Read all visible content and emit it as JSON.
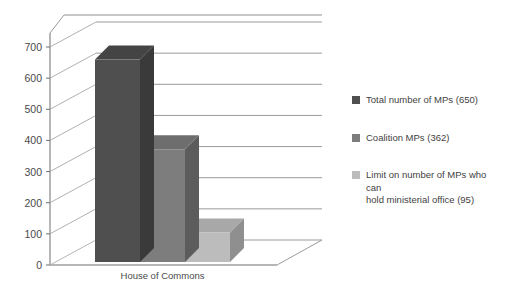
{
  "chart_data": {
    "type": "bar",
    "title": "",
    "subtitle": "",
    "xlabel": "House of Commons",
    "ylabel": "",
    "categories": [
      "House of Commons"
    ],
    "ylim": [
      0,
      700
    ],
    "yticks": [
      0,
      100,
      200,
      300,
      400,
      500,
      600,
      700
    ],
    "ytick_labels": [
      "0",
      "100",
      "200",
      "300",
      "400",
      "500",
      "600",
      "700"
    ],
    "grid": true,
    "grid_axis": "y",
    "legend_position": "right",
    "three_d": true,
    "series": [
      {
        "name": "Total number of MPs (650)",
        "values": [
          650
        ],
        "color": "#4f4f4f",
        "side_color": "#3a3a3a",
        "top_color": "#444444"
      },
      {
        "name": "Coalition MPs (362)",
        "values": [
          362
        ],
        "color": "#7d7d7d",
        "side_color": "#5c5c5c",
        "top_color": "#6e6e6e"
      },
      {
        "name": "Limit on number of MPs who can hold ministerial office (95)",
        "values": [
          95
        ],
        "color": "#bcbcbc",
        "side_color": "#8f8f8f",
        "top_color": "#a8a8a8"
      }
    ],
    "annotations": []
  },
  "legend": {
    "items": [
      {
        "label": "Total number of MPs (650)",
        "color": "#4f4f4f"
      },
      {
        "label": "Coalition MPs (362)",
        "color": "#7d7d7d"
      },
      {
        "label": "Limit on number of MPs who can\nhold ministerial office (95)",
        "color": "#bcbcbc"
      }
    ]
  },
  "axis": {
    "y_ticks": [
      "700",
      "600",
      "500",
      "400",
      "300",
      "200",
      "100",
      "0"
    ],
    "x_category": "House of Commons"
  },
  "colors": {
    "background": "#ffffff",
    "gridline": "#9a9a9a",
    "axis": "#6f6f6f",
    "text": "#3f3f3f"
  }
}
